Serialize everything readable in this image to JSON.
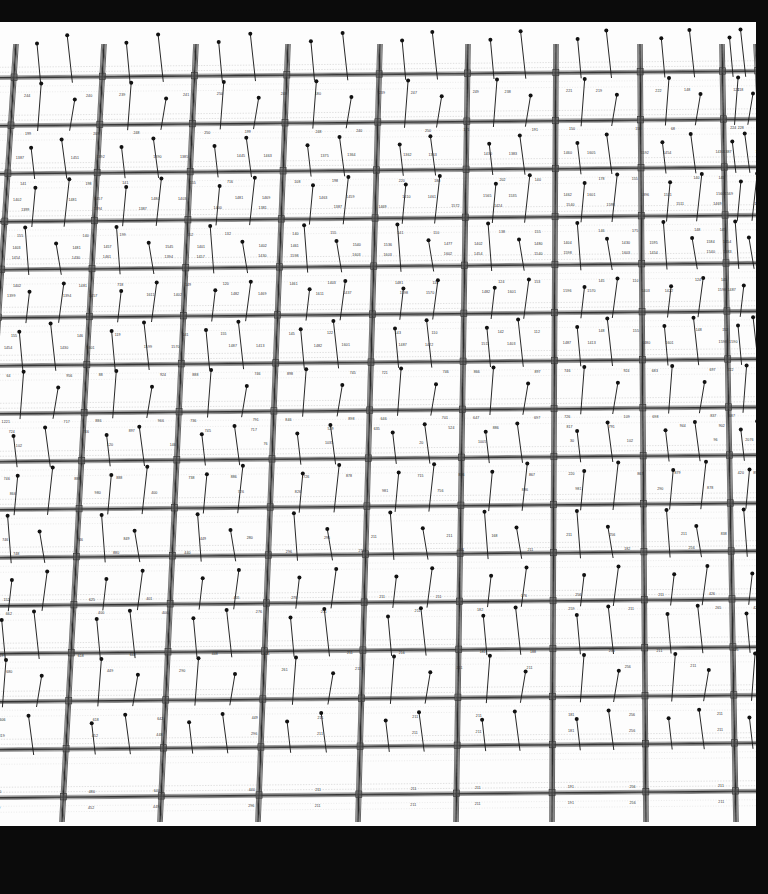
{
  "document": {
    "kind": "structural-frame-elevation",
    "description": "Multi-storey reinforced concrete frame elevation with longitudinal reinforcement area annotations at beam ends and mid-spans",
    "paper_color": "#fdfdfd",
    "line_color": "#2b2b2b",
    "letterbox_color": "#0b0b0b"
  },
  "geometry": {
    "canvas_width": 768,
    "canvas_height": 894,
    "paper_top": 22,
    "paper_bottom": 826,
    "paper_right": 756,
    "bay_count": 11,
    "storey_count": 14,
    "column_x_top": [
      16,
      104,
      196,
      288,
      380,
      468,
      556,
      640,
      722,
      756
    ],
    "column_x_bottom": [
      -34,
      62,
      160,
      258,
      358,
      456,
      552,
      646,
      736,
      800
    ],
    "storey_y": [
      52,
      100,
      148,
      196,
      244,
      292,
      340,
      388,
      436,
      484,
      532,
      580,
      628,
      676,
      724,
      772
    ],
    "perspective_shear": -0.062
  },
  "annotations": {
    "note": "Beam end / mid-span reinforcement values (mm^2). Upper storeys carry four-digit values, lower storeys three-digit values.",
    "rows": [
      {
        "storey": 1,
        "y": 72,
        "values": [
          "244",
          "240",
          "239",
          "241",
          "250",
          "248",
          "180",
          "239",
          "247",
          "249",
          "238",
          "221",
          "219",
          "222",
          "148",
          "121",
          "218"
        ]
      },
      {
        "storey": 2,
        "y": 110,
        "values": [
          "199",
          "209",
          "248",
          "250",
          "199",
          "248",
          "240",
          "250",
          "171",
          "191",
          "150",
          "158",
          "68",
          "224",
          "228"
        ]
      },
      {
        "storey": 2,
        "y": 134,
        "values": [
          "1387",
          "1451",
          "1392",
          "1390",
          "1385",
          "1445",
          "1463",
          "1375",
          "1364",
          "1362",
          "1363",
          "1430",
          "1383",
          "1460",
          "1605",
          "1592",
          "1454",
          "1430",
          "1387",
          "1603"
        ]
      },
      {
        "storey": 3,
        "y": 160,
        "values": [
          "141",
          "198",
          "141",
          "155",
          "716",
          "108",
          "198",
          "220",
          "180",
          "202",
          "140",
          "178",
          "155",
          "140",
          "145",
          "180"
        ]
      },
      {
        "storey": 3,
        "y": 176,
        "values": [
          "1402",
          "1481",
          "1457",
          "1480",
          "1403",
          "1481",
          "1469",
          "1463",
          "1459",
          "1410",
          "1461",
          "1565",
          "1535",
          "1462",
          "1601",
          "1396",
          "1511",
          "1560",
          "1569",
          "1482"
        ]
      },
      {
        "storey": 3,
        "y": 186,
        "values": [
          "1399",
          "1394",
          "1387",
          "1400",
          "1381",
          "1387",
          "1469",
          "1572",
          "1424",
          "1540",
          "1598",
          "1511",
          "1469",
          "1572"
        ]
      },
      {
        "storey": 4,
        "y": 212,
        "values": [
          "155",
          "140",
          "199",
          "152",
          "132",
          "140",
          "155",
          "141",
          "110",
          "138",
          "155",
          "146",
          "175",
          "148",
          "145",
          "200"
        ]
      },
      {
        "storey": 4,
        "y": 224,
        "values": [
          "1403",
          "1481",
          "1457",
          "1545",
          "1401",
          "1402",
          "1461",
          "1540",
          "1536",
          "1477",
          "1402",
          "1480",
          "1404",
          "1430",
          "1595",
          "1584",
          "1454",
          "1540"
        ]
      },
      {
        "storey": 4,
        "y": 234,
        "values": [
          "1454",
          "1430",
          "1461",
          "1394",
          "1457",
          "1430",
          "1598",
          "1603",
          "1603",
          "1602",
          "1454",
          "1540",
          "1598",
          "1603",
          "1454",
          "1540",
          "1383",
          "1463"
        ]
      },
      {
        "storey": 5,
        "y": 262,
        "values": [
          "1402",
          "1481",
          "718",
          "149",
          "120",
          "1461",
          "1403",
          "1481",
          "116",
          "124",
          "153",
          "145",
          "110",
          "124",
          "145",
          "120"
        ]
      },
      {
        "storey": 5,
        "y": 272,
        "values": [
          "1399",
          "1394",
          "1457",
          "1611",
          "1402",
          "1482",
          "1469",
          "1611",
          "1437",
          "1598",
          "1570",
          "1482",
          "1601",
          "1596",
          "1570",
          "1403",
          "1422",
          "1598",
          "1487",
          "1497"
        ]
      },
      {
        "storey": 6,
        "y": 312,
        "values": [
          "155",
          "146",
          "119",
          "141",
          "155",
          "145",
          "122",
          "143",
          "110",
          "142",
          "112",
          "148",
          "155",
          "148",
          "152",
          "200"
        ]
      },
      {
        "storey": 6,
        "y": 324,
        "values": [
          "1454",
          "1430",
          "1601",
          "1599",
          "1570",
          "1487",
          "1413",
          "1482",
          "1601",
          "1487",
          "1422",
          "1511",
          "1403",
          "1487",
          "1413",
          "1480",
          "1601",
          "1598",
          "1590",
          "1603"
        ]
      },
      {
        "storey": 7,
        "y": 352,
        "values": [
          "64",
          "956",
          "88",
          "924",
          "888",
          "746",
          "898",
          "745",
          "721",
          "746",
          "866",
          "897",
          "746",
          "924",
          "683",
          "697",
          "722",
          "109"
        ]
      },
      {
        "storey": 7,
        "y": 398,
        "values": [
          "1221",
          "717",
          "886",
          "966",
          "736",
          "791",
          "846",
          "898",
          "646",
          "701",
          "647",
          "697",
          "726",
          "109",
          "698",
          "837",
          "687",
          "816"
        ]
      },
      {
        "storey": 7,
        "y": 408,
        "values": [
          "724",
          "746",
          "897",
          "745",
          "717",
          "529",
          "635",
          "524",
          "886",
          "817",
          "791",
          "944",
          "902",
          "815"
        ]
      },
      {
        "storey": 8,
        "y": 422,
        "values": [
          "102",
          "120",
          "146",
          "76",
          "1035",
          "20",
          "1005",
          "30",
          "102",
          "96",
          "2076"
        ]
      },
      {
        "storey": 8,
        "y": 455,
        "values": [
          "746",
          "888",
          "888",
          "738",
          "886",
          "726",
          "878",
          "715",
          "886",
          "867",
          "220",
          "867",
          "879",
          "420",
          "898"
        ]
      },
      {
        "storey": 8,
        "y": 470,
        "values": [
          "866",
          "980",
          "400",
          "726",
          "826",
          "981",
          "756",
          "886",
          "981",
          "290",
          "878",
          "888"
        ]
      },
      {
        "storey": 9,
        "y": 516,
        "values": [
          "746",
          "746",
          "849",
          "449",
          "280",
          "296",
          "211",
          "211",
          "168",
          "211",
          "256",
          "211",
          "838",
          "844"
        ]
      },
      {
        "storey": 9,
        "y": 530,
        "values": [
          "748",
          "880",
          "440",
          "296",
          "211",
          "211",
          "211",
          "182",
          "256",
          "211"
        ]
      },
      {
        "storey": 10,
        "y": 576,
        "values": [
          "152",
          "625",
          "401",
          "405",
          "276",
          "211",
          "211",
          "176",
          "256",
          "211",
          "426",
          "866"
        ]
      },
      {
        "storey": 10,
        "y": 590,
        "values": [
          "662",
          "400",
          "400",
          "276",
          "211",
          "211",
          "182",
          "259",
          "211",
          "265",
          "426"
        ]
      },
      {
        "storey": 11,
        "y": 632,
        "values": [
          "719",
          "618",
          "642",
          "448",
          "211",
          "211",
          "216",
          "181",
          "188",
          "256",
          "211",
          "425",
          "402"
        ]
      },
      {
        "storey": 11,
        "y": 648,
        "values": [
          "680",
          "449",
          "290",
          "261",
          "211",
          "211",
          "211",
          "256",
          "211",
          "426"
        ]
      },
      {
        "storey": 12,
        "y": 696,
        "values": [
          "606",
          "618",
          "642",
          "449",
          "211",
          "211",
          "211",
          "181",
          "256",
          "211",
          "428"
        ]
      },
      {
        "storey": 12,
        "y": 712,
        "values": [
          "819",
          "452",
          "448",
          "296",
          "211",
          "211",
          "211",
          "181",
          "256",
          "211",
          "426"
        ]
      },
      {
        "storey": 13,
        "y": 768,
        "values": [
          "150",
          "480",
          "640",
          "440",
          "211",
          "211",
          "211",
          "191",
          "256",
          "211",
          "426"
        ]
      },
      {
        "storey": 13,
        "y": 784,
        "values": [
          "889",
          "452",
          "449",
          "296",
          "211",
          "211",
          "211",
          "191",
          "256",
          "211",
          "428"
        ]
      }
    ]
  },
  "markers": {
    "pin_label": "load-marker",
    "pin_count_per_bay": 2,
    "pin_length": 46,
    "head_radius": 2.0
  }
}
